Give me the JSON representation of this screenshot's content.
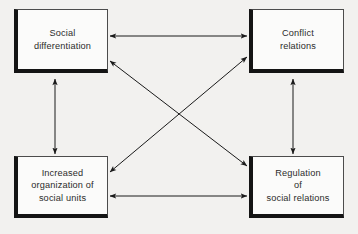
{
  "diagram": {
    "background_color": "#f2f1ef",
    "box_fill_color": "#fbfbfa",
    "box_shadow_color": "#141414",
    "arrow_color": "#1a1a1a",
    "nodes": [
      {
        "id": "social-differentiation",
        "label": "Social\ndifferentiation",
        "position": "top-left"
      },
      {
        "id": "conflict-relations",
        "label": "Conflict\nrelations",
        "position": "top-right"
      },
      {
        "id": "increased-organization",
        "label": "Increased\norganization of\nsocial units",
        "position": "bottom-left"
      },
      {
        "id": "regulation",
        "label": "Regulation\nof\nsocial relations",
        "position": "bottom-right"
      }
    ],
    "edges": [
      {
        "id": "top-horizontal",
        "from": "social-differentiation",
        "to": "conflict-relations",
        "direction": "bidirectional"
      },
      {
        "id": "bottom-horizontal",
        "from": "increased-organization",
        "to": "regulation",
        "direction": "bidirectional"
      },
      {
        "id": "left-vertical",
        "from": "social-differentiation",
        "to": "increased-organization",
        "direction": "bidirectional"
      },
      {
        "id": "right-vertical",
        "from": "conflict-relations",
        "to": "regulation",
        "direction": "bidirectional"
      },
      {
        "id": "diagonal-tl-br",
        "from": "social-differentiation",
        "to": "regulation",
        "direction": "bidirectional"
      },
      {
        "id": "diagonal-bl-tr",
        "from": "increased-organization",
        "to": "conflict-relations",
        "direction": "bidirectional"
      }
    ]
  }
}
